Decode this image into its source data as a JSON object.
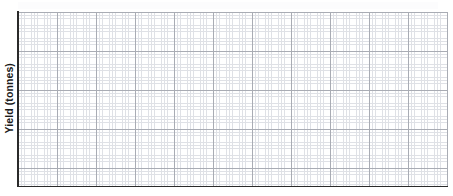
{
  "figure": {
    "background_color": "#ffffff",
    "width": 453,
    "height": 196
  },
  "axis": {
    "ylabel": "Yield (tonnes)",
    "xlabel": "",
    "title": "",
    "spine_color": "#2a2a2a",
    "x_tick_labels": [],
    "y_tick_labels": []
  },
  "grid": {
    "style": "graph-paper",
    "minor_color": "#dfe1e6",
    "major_color": "#a9acb4",
    "minor_spacing_px": 3.25,
    "major_spacing_px": 39,
    "visible": "true"
  },
  "chart_data": {
    "type": "line",
    "title": "",
    "xlabel": "",
    "ylabel": "Yield (tonnes)",
    "series": [],
    "x": [],
    "categories": [],
    "values": [],
    "xlim": [],
    "ylim": [],
    "grid": "on",
    "legend_position": "none",
    "annotations": [],
    "note": "Blank graph-paper axes: no data series, tick labels, legend or title are drawn in the image."
  }
}
